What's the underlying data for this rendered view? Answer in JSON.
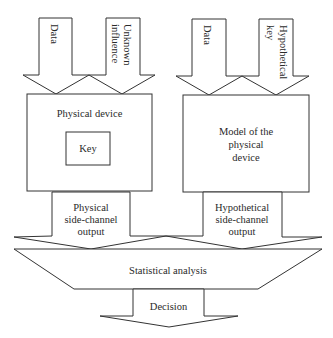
{
  "diagram": {
    "left_inputs": [
      {
        "label_lines": [
          "Data"
        ]
      },
      {
        "label_lines": [
          "Unknown",
          "influence"
        ]
      }
    ],
    "right_inputs": [
      {
        "label_lines": [
          "Data"
        ]
      },
      {
        "label_lines": [
          "Hypothetical",
          "key"
        ]
      }
    ],
    "physical_device": {
      "title": "Physical device",
      "inner_box": "Key"
    },
    "model_device": {
      "label_lines": [
        "Model of the",
        "physical",
        "device"
      ]
    },
    "physical_output": {
      "label_lines": [
        "Physical",
        "side-channel",
        "output"
      ]
    },
    "hypothetical_output": {
      "label_lines": [
        "Hypothetical",
        "side-channel",
        "output"
      ]
    },
    "analysis": {
      "label": "Statistical analysis"
    },
    "decision": {
      "label": "Decision"
    },
    "colors": {
      "stroke": "#333333",
      "fill": "#ffffff",
      "text": "#2a2a2a"
    }
  }
}
